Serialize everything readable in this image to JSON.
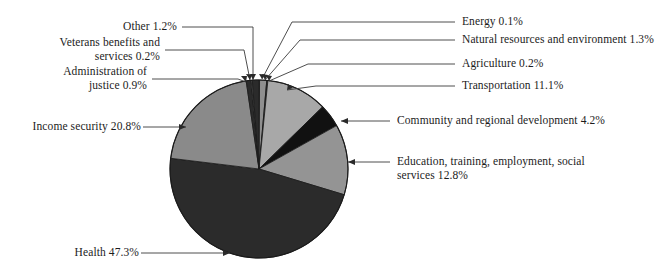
{
  "chart_data": {
    "type": "pie",
    "title": "",
    "subtitle": "",
    "xlabel": "",
    "ylabel": "",
    "legend_position": "callout-labels",
    "grid": false,
    "total_percent": 100.0,
    "categories": [
      "Energy",
      "Natural resources and environment",
      "Agriculture",
      "Transportation",
      "Community and regional development",
      "Education, training, employment, social services",
      "Health",
      "Income security",
      "Administration of justice",
      "Veterans benefits and services",
      "Other"
    ],
    "values": [
      0.1,
      1.3,
      0.2,
      11.1,
      4.2,
      12.8,
      47.3,
      20.8,
      0.9,
      0.2,
      1.2
    ],
    "slice_colors": [
      "#2b2b2b",
      "#8f8f8f",
      "#2b2b2b",
      "#a8a8a8",
      "#111111",
      "#949494",
      "#2b2b2b",
      "#8a8a8a",
      "#2b2b2b",
      "#9a9a9a",
      "#2b2b2b"
    ],
    "slices": [
      {
        "label": "Energy",
        "value": 0.1,
        "color": "#2b2b2b"
      },
      {
        "label": "Natural resources and environment",
        "value": 1.3,
        "color": "#8f8f8f"
      },
      {
        "label": "Agriculture",
        "value": 0.2,
        "color": "#2b2b2b"
      },
      {
        "label": "Transportation",
        "value": 11.1,
        "color": "#a8a8a8"
      },
      {
        "label": "Community and regional development",
        "value": 4.2,
        "color": "#111111"
      },
      {
        "label": "Education, training, employment, social services",
        "value": 12.8,
        "color": "#949494"
      },
      {
        "label": "Health",
        "value": 47.3,
        "color": "#2b2b2b"
      },
      {
        "label": "Income security",
        "value": 20.8,
        "color": "#8a8a8a"
      },
      {
        "label": "Administration of justice",
        "value": 0.9,
        "color": "#2b2b2b"
      },
      {
        "label": "Veterans benefits and services",
        "value": 0.2,
        "color": "#9a9a9a"
      },
      {
        "label": "Other",
        "value": 1.2,
        "color": "#2b2b2b"
      }
    ]
  },
  "callouts": {
    "other": "Other 1.2%",
    "veterans": "Veterans benefits and\nservices 0.2%",
    "justice": "Administration of\njustice 0.9%",
    "income_security": "Income security 20.8%",
    "health": "Health 47.3%",
    "energy": "Energy 0.1%",
    "natural_resources": "Natural resources and environment 1.3%",
    "agriculture": "Agriculture 0.2%",
    "transportation": "Transportation 11.1%",
    "community": "Community and regional development 4.2%",
    "education": "Education, training, employment, social\nservices 12.8%"
  },
  "colors": {
    "background": "#ffffff",
    "text": "#1c1c1c",
    "leader_line": "#3a3a3a",
    "outline": "#1a1a1a"
  }
}
